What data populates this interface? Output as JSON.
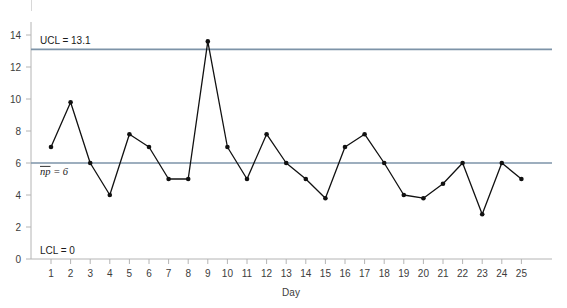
{
  "chart_data": {
    "type": "line",
    "title": "",
    "subtitle": "",
    "xlabel": "Day",
    "ylabel": "",
    "x": [
      1,
      2,
      3,
      4,
      5,
      6,
      7,
      8,
      9,
      10,
      11,
      12,
      13,
      14,
      15,
      16,
      17,
      18,
      19,
      20,
      21,
      22,
      23,
      24,
      25
    ],
    "values": [
      7,
      9.8,
      6,
      4,
      7.8,
      7,
      5,
      5,
      13.6,
      7,
      5,
      7.8,
      6,
      5,
      3.8,
      7,
      7.8,
      6,
      4,
      3.8,
      4.7,
      6,
      2.8,
      6,
      5
    ],
    "series": [
      {
        "name": "np",
        "values": [
          7,
          9.8,
          6,
          4,
          7.8,
          7,
          5,
          5,
          13.6,
          7,
          5,
          7.8,
          6,
          5,
          3.8,
          7,
          7.8,
          6,
          4,
          3.8,
          4.7,
          6,
          2.8,
          6,
          5
        ]
      }
    ],
    "xticks": [
      "1",
      "2",
      "3",
      "4",
      "5",
      "6",
      "7",
      "8",
      "9",
      "10",
      "11",
      "12",
      "13",
      "14",
      "15",
      "16",
      "17",
      "18",
      "19",
      "20",
      "21",
      "22",
      "23",
      "24",
      "25"
    ],
    "yticks": [
      "0",
      "2",
      "4",
      "6",
      "8",
      "10",
      "12",
      "14"
    ],
    "ytick_values": [
      0,
      2,
      4,
      6,
      8,
      10,
      12,
      14
    ],
    "ylim": [
      0,
      14.6
    ],
    "xlim": [
      0.4,
      25.6
    ],
    "grid": false,
    "legend": "none",
    "marker": "filled-circle",
    "control_limits": [
      {
        "id": "ucl",
        "label": "UCL = 13.1",
        "value": 13.1,
        "color": "#7d93a8"
      },
      {
        "id": "center",
        "label": "np = 6",
        "label_prefix": "np",
        "label_suffix": " = 6",
        "value": 6,
        "color": "#7d93a8"
      },
      {
        "id": "lcl",
        "label": "LCL = 0",
        "value": 0,
        "color": "#7d93a8"
      }
    ],
    "line_color": "#111111",
    "marker_color": "#111111",
    "axis_color": "#b4b4b4"
  },
  "axes": {
    "x_axis_title": "Day",
    "y_axis_title": ""
  }
}
